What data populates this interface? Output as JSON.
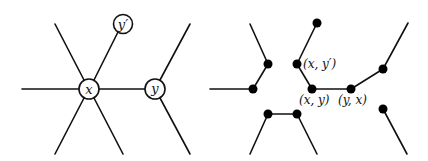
{
  "left_graph": {
    "nodes": [
      {
        "id": "x",
        "label": "x",
        "cx": 89,
        "cy": 89
      },
      {
        "id": "y",
        "label": "y",
        "cx": 155,
        "cy": 89
      },
      {
        "id": "yprime",
        "label": "y′",
        "cx": 123,
        "cy": 24
      }
    ]
  },
  "right_graph": {
    "labels": {
      "x_yprime": "(x, y′)",
      "x_y": "(x, y)",
      "y_x": "(y, x)"
    }
  },
  "colors": {
    "stroke": "#111111",
    "background": "#ffffff"
  }
}
